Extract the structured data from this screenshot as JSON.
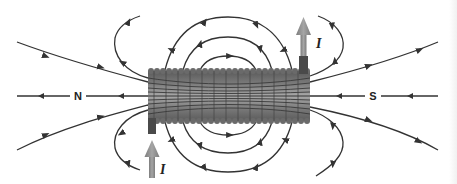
{
  "figure": {
    "labels": {
      "north_pole": "N",
      "south_pole": "S",
      "current_top": "I",
      "current_bottom": "I"
    },
    "colors": {
      "field_line": "#333333",
      "coil_dark": "#555555",
      "coil_light": "#9a9a9a",
      "current_arrow": "#8c8c8c",
      "background": "#ffffff"
    }
  }
}
